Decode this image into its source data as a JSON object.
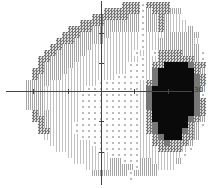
{
  "chart_data": {
    "type": "heatmap",
    "title": "",
    "axis_label_right": "30",
    "legend": {
      ".": "normal (dots)",
      "1": "light grey symbol",
      "h": "light-medium grey symbol",
      "x": "checkered grey symbol",
      "g": "dark grey",
      "b": "black (dense defect)"
    },
    "cell_size_px": 6,
    "rows": [
      "                    xxx.xxxx      ",
      "                 xxxxxx.hxxxhh    ",
      "               xxxxxxhh.hhxh11    ",
      "             xxxxhhhhhh.hhxh111   ",
      "           xxxxhhhhhhhh.hhxh111h  ",
      "          xxxhhhhh11111.111hhhhhh ",
      "         xxxhhhhh111111.11hhhhhh1 ",
      "        xxhhhhh11111111.11hhhhhhh ",
      "       xxhhhhh11111111.11.xxxxhhh.",
      "      xxhhhhh1111111111.11xxxxxxh.",
      "      xhhhhh111111111...1xxbbbbgxx",
      "     xxhhhh1111111111...1gbbbbbbxh",
      "     xhhhh111111111.....1gbbbbbbgx",
      "    hhhh11111111.......1xgbbbbbbgx",
      "    hhh1111111.........1gbbbbbbbgh",
      "    hhh111111..........1gbbbbbbbg.",
      "    hhh111111..........1gbbbbbbbgx",
      "    hhh111111..........1gbbbbbbbgx",
      "     xhh11111..........1xbbbbbbbgx",
      "     xxh11111..........1xbbbbbbgxh",
      "      xh1111...........1xgbbbbbxh.",
      "      xx1111...........1xgbbbbgxh ",
      "       111111..........11xgbbbxxh ",
      "        1111111........11xxgxxxh  ",
      "         1111111.......111xxxx1.  ",
      "           1111111.....1111111.   ",
      "            111111hh...hh1111h    ",
      "              1111hhhh.hhh111     ",
      "               hhhhhh.hhhh       ",
      "                     .           ",
      "                                  "
    ]
  }
}
